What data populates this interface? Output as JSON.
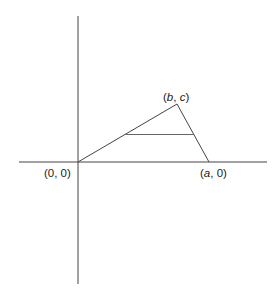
{
  "diagram": {
    "colors": {
      "background": "#ffffff",
      "axis": "#444444",
      "triangle": "#444444",
      "midline": "#666666",
      "text": "#222222"
    },
    "points": {
      "origin": {
        "label_prefix": "(",
        "label_var": "",
        "label_text": "0, 0)",
        "full": "(0, 0)"
      },
      "a": {
        "full": "(a, 0)",
        "var": "a",
        "rest": ", 0)"
      },
      "bc": {
        "full": "(b, c)",
        "var1": "b",
        "sep": ", ",
        "var2": "c"
      }
    },
    "labels": {
      "origin": "(0, 0)",
      "a_open": "(",
      "a_var": "a",
      "a_close": ", 0)",
      "bc_open": "(",
      "bc_var1": "b",
      "bc_sep": ", ",
      "bc_var2": "c",
      "bc_close": ")"
    },
    "segments": [
      {
        "name": "triangle-side-origin-to-bc",
        "from": "(0, 0)",
        "to": "(b, c)"
      },
      {
        "name": "triangle-side-bc-to-a",
        "from": "(b, c)",
        "to": "(a, 0)"
      },
      {
        "name": "triangle-base-origin-to-a",
        "from": "(0, 0)",
        "to": "(a, 0)"
      },
      {
        "name": "midline",
        "description": "horizontal segment parallel to base connecting the two slanted sides"
      }
    ]
  }
}
